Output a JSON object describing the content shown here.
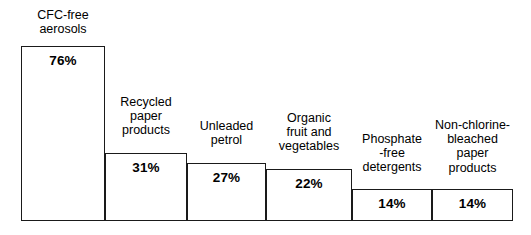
{
  "chart_data": {
    "type": "bar",
    "title": "",
    "subtitle": "",
    "xlabel": "",
    "ylabel": "",
    "ylim": [
      0,
      80
    ],
    "grid": false,
    "legend": "none",
    "orientation": "vertical",
    "value_suffix": "%",
    "categories": [
      "CFC-free aerosols",
      "Recycled paper products",
      "Unleaded petrol",
      "Organic fruit and vegetables",
      "Phosphate-free detergents",
      "Non-chlorine-bleached paper products"
    ],
    "values": [
      76,
      31,
      27,
      22,
      14,
      14
    ],
    "value_labels": [
      "76%",
      "31%",
      "27%",
      "22%",
      "14%",
      "14%"
    ],
    "colors": {
      "bar_fill": "#ffffff",
      "bar_stroke": "#1a1a1a",
      "text": "#000000",
      "background": "#ffffff"
    },
    "bars": [
      {
        "name": "cfc-free-aerosols",
        "value": 76,
        "value_label": "76%",
        "label_lines": [
          "CFC-free",
          "aerosols"
        ],
        "geom": {
          "left": 0,
          "width": 84,
          "height": 175
        },
        "label_geom": {
          "left": -4,
          "top": 8,
          "width": 92
        }
      },
      {
        "name": "recycled-paper-products",
        "value": 31,
        "value_label": "31%",
        "label_lines": [
          "Recycled",
          "paper",
          "products"
        ],
        "geom": {
          "left": 84,
          "width": 82,
          "height": 68
        },
        "label_geom": {
          "left": 78,
          "top": 95,
          "width": 94
        }
      },
      {
        "name": "unleaded-petrol",
        "value": 27,
        "value_label": "27%",
        "label_lines": [
          "Unleaded",
          "petrol"
        ],
        "geom": {
          "left": 166,
          "width": 79,
          "height": 58
        },
        "label_geom": {
          "left": 160,
          "top": 119,
          "width": 91
        }
      },
      {
        "name": "organic-fruit-and-vegetables",
        "value": 22,
        "value_label": "22%",
        "label_lines": [
          "Organic",
          "fruit and",
          "vegetables"
        ],
        "geom": {
          "left": 245,
          "width": 86,
          "height": 52
        },
        "label_geom": {
          "left": 241,
          "top": 111,
          "width": 94
        }
      },
      {
        "name": "phosphate-free-detergents",
        "value": 14,
        "value_label": "14%",
        "label_lines": [
          "Phosphate",
          "-free",
          "detergents"
        ],
        "geom": {
          "left": 331,
          "width": 80,
          "height": 32
        },
        "label_geom": {
          "left": 325,
          "top": 132,
          "width": 92
        }
      },
      {
        "name": "non-chlorine-bleached-paper-products",
        "value": 14,
        "value_label": "14%",
        "label_lines": [
          "Non-chlorine-",
          "bleached",
          "paper",
          "products"
        ],
        "geom": {
          "left": 411,
          "width": 81,
          "height": 32
        },
        "label_geom": {
          "left": 403,
          "top": 118,
          "width": 97
        }
      }
    ]
  }
}
